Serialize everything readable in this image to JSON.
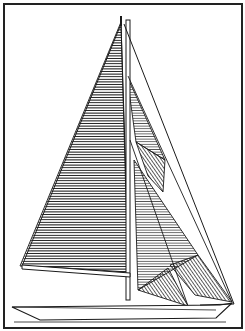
{
  "image": {
    "subject": "sailboat-sail-plan",
    "style": "black-and-white line drawing with hatched sails",
    "colors": {
      "ink": "#1a1a1a",
      "paper": "#ffffff"
    },
    "elements": [
      "frame",
      "mast",
      "mainsail",
      "jib",
      "staysail",
      "forestay",
      "boom",
      "hull",
      "bowsprit"
    ]
  }
}
